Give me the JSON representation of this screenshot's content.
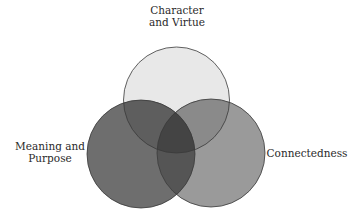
{
  "diagram": {
    "type": "venn",
    "sets": [
      {
        "id": "character-virtue",
        "label_lines": [
          "Character",
          "and Virtue"
        ],
        "fill": "#e8e8e8",
        "stroke": "#3a3a3a",
        "cx": 176.5,
        "cy": 100,
        "r": 53
      },
      {
        "id": "meaning-purpose",
        "label_lines": [
          "Meaning and",
          "Purpose"
        ],
        "fill": "#6e6e6e",
        "stroke": "#3a3a3a",
        "cx": 141,
        "cy": 154,
        "r": 54
      },
      {
        "id": "connectedness",
        "label_lines": [
          "Connectedness"
        ],
        "fill": "#9a9a9a",
        "stroke": "#3a3a3a",
        "cx": 211,
        "cy": 153,
        "r": 54
      }
    ],
    "overlap_colors": {
      "character_meaning": "#5e5e5e",
      "character_connectedness": "#8a8a8a",
      "meaning_connectedness": "#555555",
      "all_three": "#444444"
    }
  }
}
